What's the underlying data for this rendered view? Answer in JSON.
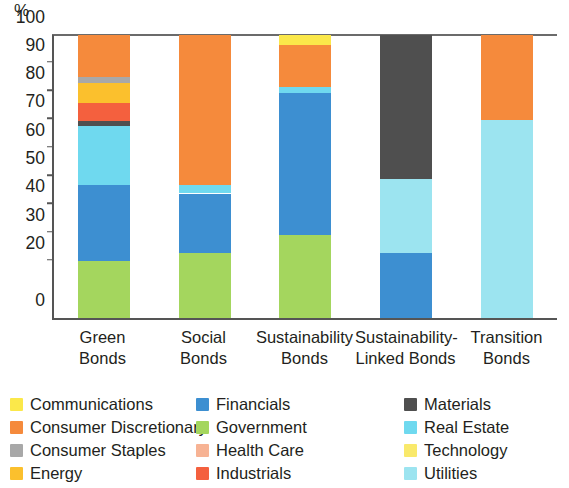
{
  "axis": {
    "unit": "%",
    "y_ticks": [
      0,
      20,
      30,
      40,
      50,
      60,
      70,
      80,
      90,
      100
    ],
    "y_min": 0,
    "y_max": 100
  },
  "legend": {
    "items": [
      {
        "label": "Communications",
        "color": "#fbe84a"
      },
      {
        "label": "Consumer Discretionary",
        "color": "#f58a3c"
      },
      {
        "label": "Consumer Staples",
        "color": "#a8a8a8"
      },
      {
        "label": "Energy",
        "color": "#fbc02d"
      },
      {
        "label": "Financials",
        "color": "#3d8fd1"
      },
      {
        "label": "Government",
        "color": "#a4d65e"
      },
      {
        "label": "Health Care",
        "color": "#f7b394"
      },
      {
        "label": "Industrials",
        "color": "#f4603e"
      },
      {
        "label": "Materials",
        "color": "#4f4f4f"
      },
      {
        "label": "Real Estate",
        "color": "#6fd9ef"
      },
      {
        "label": "Technology",
        "color": "#f9e96b"
      },
      {
        "label": "Utilities",
        "color": "#9ce4f0"
      }
    ]
  },
  "chart_data": {
    "type": "bar",
    "stacked": true,
    "title": "",
    "xlabel": "",
    "ylabel": "%",
    "ylim": [
      0,
      100
    ],
    "grid": false,
    "legend_position": "bottom",
    "categories": [
      "Green\nBonds",
      "Social\nBonds",
      "Sustainability\nBonds",
      "Sustainability-\nLinked Bonds",
      "Transition\nBonds"
    ],
    "series": [
      {
        "name": "Government",
        "color": "#a4d65e",
        "values": [
          20,
          23,
          29.5,
          0,
          0
        ]
      },
      {
        "name": "Financials",
        "color": "#3d8fd1",
        "values": [
          27,
          21,
          50,
          23,
          0
        ]
      },
      {
        "name": "Real Estate",
        "color": "#6fd9ef",
        "values": [
          21,
          3,
          2,
          0,
          0
        ]
      },
      {
        "name": "Utilities",
        "color": "#9ce4f0",
        "values": [
          0,
          0,
          0,
          26,
          70
        ]
      },
      {
        "name": "Materials",
        "color": "#4f4f4f",
        "values": [
          1.5,
          0,
          0,
          51,
          0
        ]
      },
      {
        "name": "Industrials",
        "color": "#f4603e",
        "values": [
          6.5,
          0,
          0,
          0,
          0
        ]
      },
      {
        "name": "Energy",
        "color": "#fbc02d",
        "values": [
          7,
          0,
          0,
          0,
          0
        ]
      },
      {
        "name": "Consumer Staples",
        "color": "#a8a8a8",
        "values": [
          2,
          0,
          0,
          0,
          0
        ]
      },
      {
        "name": "Consumer Discretionary",
        "color": "#f58a3c",
        "values": [
          15,
          53,
          15,
          0,
          30
        ]
      },
      {
        "name": "Communications",
        "color": "#fbe84a",
        "values": [
          0,
          0,
          3.5,
          0,
          0
        ]
      }
    ],
    "stacks": [
      {
        "category": "Green Bonds",
        "segments": [
          {
            "name": "Government",
            "color": "#a4d65e",
            "from": 0,
            "to": 20
          },
          {
            "name": "Financials",
            "color": "#3d8fd1",
            "from": 20,
            "to": 47
          },
          {
            "name": "Real Estate",
            "color": "#6fd9ef",
            "from": 47,
            "to": 68
          },
          {
            "name": "Materials",
            "color": "#4f4f4f",
            "from": 68,
            "to": 69.5
          },
          {
            "name": "Industrials",
            "color": "#f4603e",
            "from": 69.5,
            "to": 76
          },
          {
            "name": "Energy",
            "color": "#fbc02d",
            "from": 76,
            "to": 83
          },
          {
            "name": "Consumer Staples",
            "color": "#a8a8a8",
            "from": 83,
            "to": 85
          },
          {
            "name": "Consumer Discretionary",
            "color": "#f58a3c",
            "from": 85,
            "to": 100
          }
        ]
      },
      {
        "category": "Social Bonds",
        "segments": [
          {
            "name": "Government",
            "color": "#a4d65e",
            "from": 0,
            "to": 23
          },
          {
            "name": "Financials",
            "color": "#3d8fd1",
            "from": 23,
            "to": 44
          },
          {
            "name": "Real Estate",
            "color": "#6fd9ef",
            "from": 44,
            "to": 47
          },
          {
            "name": "Consumer Discretionary",
            "color": "#f58a3c",
            "from": 47,
            "to": 100
          }
        ]
      },
      {
        "category": "Sustainability Bonds",
        "segments": [
          {
            "name": "Government",
            "color": "#a4d65e",
            "from": 0,
            "to": 29.5
          },
          {
            "name": "Financials",
            "color": "#3d8fd1",
            "from": 29.5,
            "to": 79.5
          },
          {
            "name": "Real Estate",
            "color": "#6fd9ef",
            "from": 79.5,
            "to": 81.5
          },
          {
            "name": "Consumer Discretionary",
            "color": "#f58a3c",
            "from": 81.5,
            "to": 96.5
          },
          {
            "name": "Communications",
            "color": "#fbe84a",
            "from": 96.5,
            "to": 100
          }
        ]
      },
      {
        "category": "Sustainability-Linked Bonds",
        "segments": [
          {
            "name": "Financials",
            "color": "#3d8fd1",
            "from": 0,
            "to": 23
          },
          {
            "name": "Utilities",
            "color": "#9ce4f0",
            "from": 23,
            "to": 49
          },
          {
            "name": "Materials",
            "color": "#4f4f4f",
            "from": 49,
            "to": 100
          }
        ]
      },
      {
        "category": "Transition Bonds",
        "segments": [
          {
            "name": "Utilities",
            "color": "#9ce4f0",
            "from": 0,
            "to": 70
          },
          {
            "name": "Consumer Discretionary",
            "color": "#f58a3c",
            "from": 70,
            "to": 100
          }
        ]
      }
    ]
  }
}
